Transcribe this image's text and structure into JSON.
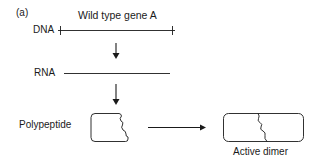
{
  "panel_label": "(a)",
  "title": "Wild type gene A",
  "rows": {
    "dna": {
      "label": "DNA"
    },
    "rna": {
      "label": "RNA"
    },
    "polypeptide": {
      "label": "Polypeptide"
    }
  },
  "product": {
    "label": "Active dimer"
  },
  "colors": {
    "ink": "#1a1a1a",
    "background": "#ffffff"
  }
}
